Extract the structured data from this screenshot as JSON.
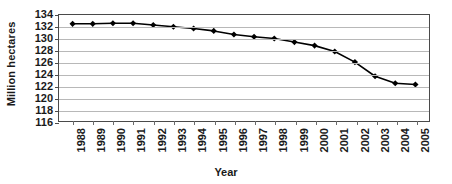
{
  "chart_data": {
    "type": "line",
    "title": "",
    "xlabel": "Year",
    "ylabel": "Million hectares",
    "categories": [
      "1988",
      "1989",
      "1990",
      "1991",
      "1992",
      "1993",
      "1994",
      "1995",
      "1996",
      "1997",
      "1998",
      "1999",
      "2000",
      "2001",
      "2002",
      "2003",
      "2004",
      "2005"
    ],
    "values": [
      132.5,
      132.5,
      132.6,
      132.6,
      132.3,
      132.0,
      131.7,
      131.3,
      130.7,
      130.3,
      130.0,
      129.4,
      128.8,
      127.8,
      126.0,
      123.6,
      122.4,
      122.2
    ],
    "series": [
      {
        "name": "Million hectares",
        "values": [
          132.5,
          132.5,
          132.6,
          132.6,
          132.3,
          132.0,
          131.7,
          131.3,
          130.7,
          130.3,
          130.0,
          129.4,
          128.8,
          127.8,
          126.0,
          123.6,
          122.4,
          122.2
        ]
      }
    ],
    "ylim": [
      116,
      134
    ],
    "yticks": [
      116,
      118,
      120,
      122,
      124,
      126,
      128,
      130,
      132,
      134
    ],
    "ytick_labels": [
      "116",
      "118",
      "120",
      "122",
      "124",
      "126",
      "128",
      "130",
      "132",
      "134"
    ],
    "grid": true,
    "grid_axis": "y",
    "legend": false,
    "marker": "diamond",
    "line_color": "#000000",
    "marker_color": "#000000",
    "grid_color": "#b8b8b8",
    "axis_color": "#4a4a4a",
    "background_color": "#ffffff",
    "xtick_rotation": 90
  }
}
